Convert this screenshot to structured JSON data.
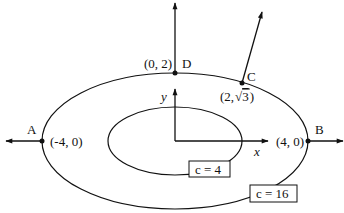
{
  "diagram": {
    "points": {
      "A": {
        "name": "A",
        "coord": "(-4, 0)"
      },
      "B": {
        "name": "B",
        "coord": "(4, 0)"
      },
      "C": {
        "name": "C",
        "coord_prefix": "(2,",
        "coord_sqrt": "3",
        "coord_suffix": ")"
      },
      "D": {
        "name": "D",
        "coord": "(0, 2)"
      }
    },
    "axes": {
      "x": "x",
      "y": "y"
    },
    "level_curves": [
      {
        "label": "c = 4"
      },
      {
        "label": "c = 16"
      }
    ],
    "colors": {
      "stroke": "#111111",
      "background": "#ffffff"
    }
  }
}
